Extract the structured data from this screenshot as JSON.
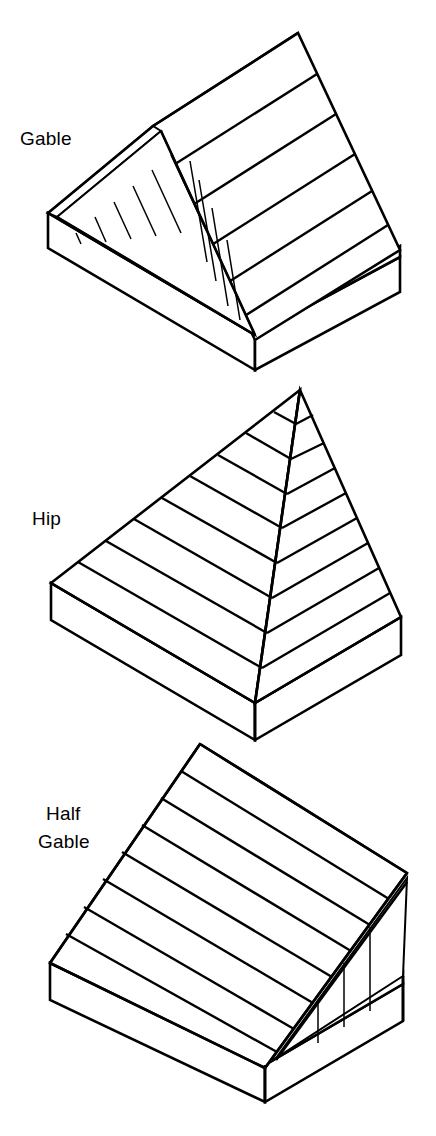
{
  "figure": {
    "background_color": "#ffffff",
    "line_color": "#000000",
    "fill_color": "#ffffff",
    "width": 436,
    "height": 1136,
    "style": "isometric line drawing"
  },
  "diagrams": [
    {
      "id": "gable",
      "label": "Gable",
      "label_lines": [
        "Gable"
      ],
      "label_x": 20,
      "label_y": 145,
      "description": "Double-sloped gable roof with framed triangular gable end",
      "stud_count": 10,
      "course_count_visible": 8
    },
    {
      "id": "hip",
      "label": "Hip",
      "label_lines": [
        "Hip"
      ],
      "label_x": 32,
      "label_y": 525,
      "description": "Pyramidal hip roof with two visible sloped faces meeting at a hip ridge",
      "stud_count": 0,
      "course_count_visible": 9
    },
    {
      "id": "half-gable",
      "label": "Half Gable",
      "label_lines": [
        "Half",
        "Gable"
      ],
      "label_x": 46,
      "label_y": 820,
      "description": "Single-slope shed roof with a triangular gable end wall",
      "stud_count": 3,
      "course_count_visible": 7
    }
  ],
  "labels": {
    "gable": "Gable",
    "hip": "Hip",
    "half_line1": "Half",
    "half_line2": "Gable"
  }
}
